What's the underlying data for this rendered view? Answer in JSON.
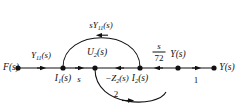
{
  "figure": {
    "type": "signal-flow-graph",
    "background_color": "#ffffff",
    "ink_color": "#111111"
  },
  "nodes": [
    {
      "id": "F",
      "label": "F(s)",
      "label_position": "left",
      "x": 18,
      "y": 68,
      "label_x": 11,
      "label_y": 68
    },
    {
      "id": "I1",
      "label": "I₁(s)",
      "label_position": "below",
      "x": 63,
      "y": 68,
      "label_x": 63,
      "label_y": 79
    },
    {
      "id": "U2",
      "label": "U₂(s)",
      "label_position": "above",
      "x": 95,
      "y": 68,
      "label_x": 97,
      "label_y": 53
    },
    {
      "id": "I2",
      "label": "I₂(s)",
      "label_position": "below",
      "x": 140,
      "y": 68,
      "label_x": 140,
      "label_y": 79
    },
    {
      "id": "Ys",
      "label": "Y(s)",
      "label_position": "above",
      "x": 178,
      "y": 68,
      "label_x": 178,
      "label_y": 55
    },
    {
      "id": "Yo",
      "label": "Y(s)",
      "label_position": "right",
      "x": 214,
      "y": 68,
      "label_x": 227,
      "label_y": 68
    }
  ],
  "branches": [
    {
      "id": "b-f-i1",
      "from": "F",
      "to": "I1",
      "gain": "Y₁₁(s)",
      "shape": "straight",
      "arrow_direction": "right",
      "label_x": 41,
      "label_y": 56
    },
    {
      "id": "b-i1-u2",
      "from": "I1",
      "to": "U2",
      "gain": "s",
      "shape": "straight",
      "arrow_direction": "right",
      "label_x": 79,
      "label_y": 79
    },
    {
      "id": "b-u2-i2",
      "from": "U2",
      "to": "I2",
      "gain": "−Z₂(s)",
      "shape": "straight",
      "arrow_direction": "left",
      "label_x": 117,
      "label_y": 79
    },
    {
      "id": "b-i2-ys",
      "from": "I2",
      "to": "Ys",
      "gain": "s/72",
      "shape": "straight",
      "arrow_direction": "left",
      "label_x": 159,
      "label_y": 52
    },
    {
      "id": "b-ys-yo",
      "from": "Ys",
      "to": "Yo",
      "gain": "1",
      "shape": "straight",
      "arrow_direction": "right",
      "label_x": 196,
      "label_y": 80
    },
    {
      "id": "b-arc-top",
      "from": "I1",
      "to": "I2",
      "gain": "sY₁₁(s)",
      "shape": "arc-above",
      "arrow_direction": "left",
      "label_x": 101,
      "label_y": 26
    },
    {
      "id": "b-arc-bottom",
      "from": "U2",
      "to": "I2",
      "gain": "2",
      "shape": "arc-below",
      "arrow_direction": "right",
      "label_x": 116,
      "label_y": 94
    }
  ],
  "fraction_gain": {
    "numerator": "s",
    "denominator": "72"
  }
}
